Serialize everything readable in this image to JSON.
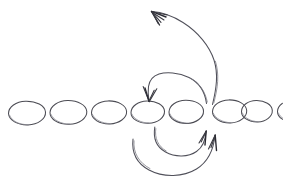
{
  "figure": {
    "title": "Hand-drawn chain of ellipses with curved arrows",
    "description": "A sketched horizontal sequence of eight ellipses split into a left group of five and a right group of three, overlaid with three curved arrows.",
    "background_color": "#ffffff",
    "stroke_color": "#4c4c54",
    "accent_stroke_color": "#2b2b33",
    "width": 283,
    "height": 180
  },
  "nodes": {
    "label": "ellipse-chain",
    "count": 8,
    "left_group_count": 5,
    "right_group_count": 3,
    "items": [
      {
        "name": "ellipse-1",
        "cx": 31,
        "cy": 114,
        "rx": 23,
        "ry": 13.5,
        "group": "left"
      },
      {
        "name": "ellipse-2",
        "cx": 73,
        "cy": 113,
        "rx": 23,
        "ry": 13.5,
        "group": "left"
      },
      {
        "name": "ellipse-3",
        "cx": 114,
        "cy": 113,
        "rx": 22,
        "ry": 13,
        "group": "left"
      },
      {
        "name": "ellipse-4",
        "cx": 153,
        "cy": 113,
        "rx": 21,
        "ry": 13,
        "group": "left"
      },
      {
        "name": "ellipse-5",
        "cx": 192,
        "cy": 112,
        "rx": 21,
        "ry": 13.5,
        "group": "left"
      },
      {
        "name": "ellipse-6",
        "cx": 241,
        "cy": 112,
        "rx": 22,
        "ry": 13.5,
        "group": "right"
      },
      {
        "name": "ellipse-7",
        "cx": 281,
        "cy": 112,
        "rx": 20,
        "ry": 12.5,
        "group": "right"
      },
      {
        "name": "ellipse-8",
        "cx": 318,
        "cy": 112,
        "rx": 20,
        "ry": 12.5,
        "group": "right"
      }
    ]
  },
  "arrows": [
    {
      "name": "arc-over-pointing-left",
      "direction": "right-to-left",
      "arrowhead": "down-left",
      "head_x": 149,
      "head_y": 101,
      "tail_x": 207,
      "tail_y": 103,
      "apex_y": 76
    },
    {
      "name": "long-arrow-up-left",
      "direction": "up-and-left",
      "arrowhead": "up-left",
      "head_x": 151,
      "head_y": 12,
      "tail_x": 212,
      "tail_y": 104,
      "apex_y": 12
    },
    {
      "name": "lower-arc-inner",
      "direction": "left-to-right",
      "arrowhead": "up-right",
      "head_x": 206,
      "head_y": 131,
      "tail_x": 155,
      "tail_y": 127,
      "apex_y": 155
    },
    {
      "name": "lower-arc-outer",
      "direction": "left-to-right",
      "arrowhead": "up",
      "head_x": 215,
      "head_y": 135,
      "tail_x": 133,
      "tail_y": 139,
      "apex_y": 172
    }
  ]
}
